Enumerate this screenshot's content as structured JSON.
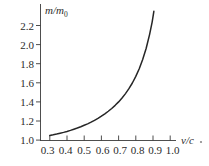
{
  "chart_data": {
    "type": "line",
    "title": "",
    "subtitle": "",
    "xlabel": "v/c",
    "xlabel_main": "v/c",
    "ylabel": "m/m0",
    "ylabel_main": "m/m",
    "ylabel_sub": "0",
    "xlim": [
      0.26,
      1.06
    ],
    "ylim": [
      1.0,
      2.32
    ],
    "grid": false,
    "legend": null,
    "legend_position": "none",
    "annotations": [],
    "trailing_mark": ".",
    "xticks": [
      "0.3",
      "0.4",
      "0.5",
      "0.6",
      "0.7",
      "0.8",
      "0.9",
      "1.0"
    ],
    "xtick_values": [
      0.3,
      0.4,
      0.5,
      0.6,
      0.7,
      0.8,
      0.9,
      1.0
    ],
    "yticks": [
      "1.0",
      "1.2",
      "1.4",
      "1.6",
      "1.8",
      "2.0",
      "2.2"
    ],
    "ytick_values": [
      1.0,
      1.2,
      1.4,
      1.6,
      1.8,
      2.0,
      2.2
    ],
    "series": [
      {
        "name": "relativistic mass ratio",
        "x": [
          0.3,
          0.32,
          0.34,
          0.36,
          0.38,
          0.4,
          0.42,
          0.44,
          0.46,
          0.48,
          0.5,
          0.52,
          0.54,
          0.56,
          0.58,
          0.6,
          0.62,
          0.64,
          0.66,
          0.68,
          0.7,
          0.72,
          0.74,
          0.76,
          0.78,
          0.8,
          0.82,
          0.84,
          0.86,
          0.88,
          0.895,
          0.905
        ],
        "values": [
          1.048,
          1.055,
          1.063,
          1.072,
          1.081,
          1.091,
          1.102,
          1.114,
          1.126,
          1.14,
          1.155,
          1.17,
          1.188,
          1.207,
          1.227,
          1.25,
          1.275,
          1.302,
          1.331,
          1.364,
          1.4,
          1.441,
          1.487,
          1.539,
          1.598,
          1.667,
          1.747,
          1.843,
          1.959,
          2.105,
          2.236,
          2.349
        ],
        "color": "#262626",
        "style": "solid"
      }
    ],
    "colors": {
      "curve": "#262626",
      "axis": "#3a3a3a",
      "text": "#2b2b2b",
      "background": "#ffffff"
    }
  }
}
